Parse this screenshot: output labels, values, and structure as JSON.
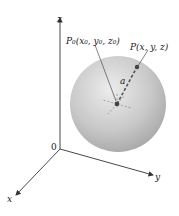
{
  "diagram": {
    "axes": {
      "z_label": "z",
      "y_label": "y",
      "x_label": "x",
      "origin_label": "0"
    },
    "labels": {
      "center_point": "P₀(x₀, y₀, z₀)",
      "surface_point": "P(x, y, z)",
      "radius": "a"
    },
    "colors": {
      "sphere_light": "#e8e8e8",
      "sphere_dark": "#a9a9a9",
      "axis": "#333333",
      "radius_dash": "#555555",
      "point": "#444444"
    }
  }
}
